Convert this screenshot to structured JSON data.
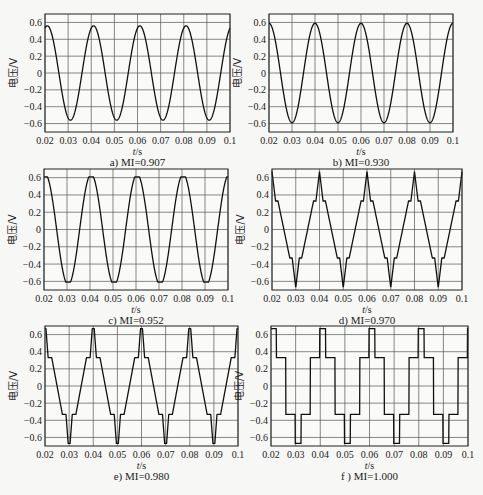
{
  "figure": {
    "y_label": "电压/V",
    "x_label": "t/s",
    "x_label_var": "t",
    "x_label_unit": "/s"
  },
  "chart_data": [
    {
      "panel": "a",
      "caption": "a) MI=0.907",
      "type": "line",
      "waveform": "sine",
      "amplitude": 0.56,
      "period": 0.02,
      "phase_peak_at": 0.021,
      "xlim": [
        0.02,
        0.1
      ],
      "ylim": [
        -0.7,
        0.7
      ],
      "xticks": [
        "0.02",
        "0.03",
        "0.04",
        "0.05",
        "0.06",
        "0.07",
        "0.08",
        "0.09",
        "0.1"
      ],
      "yticks": [
        "0.6",
        "0.4",
        "0.2",
        "0",
        "-0.2",
        "-0.4",
        "-0.6"
      ],
      "xlabel": "t/s",
      "ylabel": "电压/V",
      "grid": true
    },
    {
      "panel": "b",
      "caption": "b) MI=0.930",
      "type": "line",
      "waveform": "sine",
      "amplitude": 0.59,
      "period": 0.02,
      "phase_peak_at": 0.02,
      "xlim": [
        0.02,
        0.1
      ],
      "ylim": [
        -0.7,
        0.7
      ],
      "xticks": [
        "0.02",
        "0.03",
        "0.04",
        "0.05",
        "0.06",
        "0.07",
        "0.08",
        "0.09",
        "0.1"
      ],
      "yticks": [
        "0.6",
        "0.4",
        "0.2",
        "0",
        "-0.2",
        "-0.4",
        "-0.6"
      ],
      "xlabel": "t/s",
      "ylabel": "电压/V",
      "grid": true
    },
    {
      "panel": "c",
      "caption": "c) MI=0.952",
      "type": "line",
      "waveform": "sine-flat",
      "amplitude": 0.61,
      "period": 0.02,
      "phase_peak_at": 0.0205,
      "xlim": [
        0.02,
        0.1
      ],
      "ylim": [
        -0.7,
        0.7
      ],
      "xticks": [
        "0.02",
        "0.03",
        "0.04",
        "0.05",
        "0.06",
        "0.07",
        "0.08",
        "0.09",
        "0.1"
      ],
      "yticks": [
        "0.6",
        "0.4",
        "0.2",
        "0",
        "-0.2",
        "-0.4",
        "-0.6"
      ],
      "xlabel": "t/s",
      "ylabel": "电压/V",
      "grid": true
    },
    {
      "panel": "d",
      "caption": "d) MI=0.970",
      "type": "line",
      "waveform": "staircase-ramp",
      "levels": [
        0.67,
        0.33,
        -0.33,
        -0.67
      ],
      "period": 0.02,
      "phase_peak_at": 0.02,
      "xlim": [
        0.02,
        0.1
      ],
      "ylim": [
        -0.7,
        0.7
      ],
      "xticks": [
        "0.02",
        "0.03",
        "0.04",
        "0.05",
        "0.06",
        "0.07",
        "0.08",
        "0.09",
        "0.1"
      ],
      "yticks": [
        "0.6",
        "0.4",
        "0.2",
        "0",
        "-0.2",
        "-0.4",
        "-0.6"
      ],
      "xlabel": "t/s",
      "ylabel": "电压/V",
      "grid": true
    },
    {
      "panel": "e",
      "caption": "e) MI=0.980",
      "type": "line",
      "waveform": "staircase-steep",
      "levels": [
        0.67,
        0.33,
        -0.33,
        -0.67
      ],
      "period": 0.02,
      "phase_peak_at": 0.02,
      "xlim": [
        0.02,
        0.1
      ],
      "ylim": [
        -0.7,
        0.7
      ],
      "xticks": [
        "0.02",
        "0.03",
        "0.04",
        "0.05",
        "0.06",
        "0.07",
        "0.08",
        "0.09",
        "0.1"
      ],
      "yticks": [
        "0.6",
        "0.4",
        "0.2",
        "0",
        "-0.2",
        "-0.4",
        "-0.6"
      ],
      "xlabel": "t/s",
      "ylabel": "电压/V",
      "grid": true
    },
    {
      "panel": "f",
      "caption": "f ) MI=1.000",
      "type": "line",
      "waveform": "staircase-square",
      "levels": [
        0.67,
        0.33,
        -0.33,
        -0.67
      ],
      "period": 0.02,
      "phase_peak_at": 0.021,
      "xlim": [
        0.02,
        0.1
      ],
      "ylim": [
        -0.7,
        0.7
      ],
      "xticks": [
        "0.02",
        "0.03",
        "0.04",
        "0.05",
        "0.06",
        "0.07",
        "0.08",
        "0.09",
        "0.1"
      ],
      "yticks": [
        "0.6",
        "0.4",
        "0.2",
        "0",
        "-0.2",
        "-0.4",
        "-0.6"
      ],
      "xlabel": "t/s",
      "ylabel": "电压/V",
      "grid": true
    }
  ]
}
